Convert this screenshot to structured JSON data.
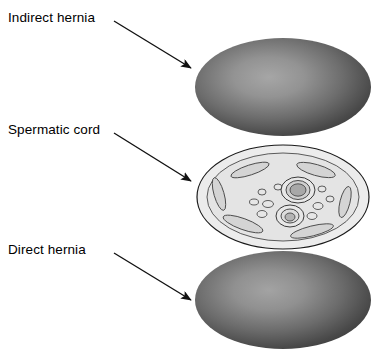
{
  "figure": {
    "type": "anatomical-diagram",
    "background_color": "#ffffff",
    "width": 380,
    "height": 354
  },
  "labels": {
    "indirect": "Indirect hernia",
    "spermatic": "Spermatic cord",
    "direct": "Direct hernia"
  },
  "annotations": [
    {
      "name": "indirect-hernia",
      "text": "Indirect hernia",
      "label_x": 8,
      "label_y": 10,
      "leader_start": [
        114,
        21
      ],
      "leader_end": [
        193,
        69
      ]
    },
    {
      "name": "spermatic-cord",
      "text": "Spermatic cord",
      "label_x": 8,
      "label_y": 122,
      "leader_start": [
        114,
        133
      ],
      "leader_end": [
        193,
        182
      ]
    },
    {
      "name": "direct-hernia",
      "text": "Direct hernia",
      "label_x": 8,
      "label_y": 242,
      "leader_start": [
        114,
        253
      ],
      "leader_end": [
        193,
        301
      ]
    }
  ],
  "shapes": {
    "indirect_hernia_mass": {
      "name": "indirect-hernia-mass",
      "shape": "ellipse",
      "cx": 283,
      "cy": 87,
      "rx": 88,
      "ry": 49,
      "fill_center": "#9a9a9a",
      "fill_edge": "#3c3c3c",
      "highlight_offset": [
        0.42,
        0.4
      ]
    },
    "spermatic_cord_disc": {
      "name": "spermatic-cord-disc",
      "shape": "ellipse",
      "cx": 283,
      "cy": 197,
      "rx": 86,
      "ry": 52,
      "fill": "#ececec",
      "stroke": "#1a1a1a",
      "inner_ring": {
        "rx": 76,
        "ry": 44,
        "fill": "#e2e2e2",
        "stroke": "#3a3a3a"
      }
    },
    "direct_hernia_mass": {
      "name": "direct-hernia-mass",
      "shape": "ellipse",
      "cx": 283,
      "cy": 300,
      "rx": 88,
      "ry": 49,
      "fill_center": "#9a9a9a",
      "fill_edge": "#3c3c3c",
      "highlight_offset": [
        0.42,
        0.4
      ]
    }
  },
  "cord_contents": {
    "cremaster_fibers": [
      {
        "name": "cremaster-fiber-top-left",
        "cx": 250,
        "cy": 170,
        "rx": 20,
        "ry": 5,
        "rotate": -18
      },
      {
        "name": "cremaster-fiber-top-right",
        "cx": 316,
        "cy": 170,
        "rx": 20,
        "ry": 5.5,
        "rotate": 16
      },
      {
        "name": "cremaster-fiber-left",
        "cx": 219,
        "cy": 194,
        "rx": 17,
        "ry": 5,
        "rotate": 74
      },
      {
        "name": "cremaster-fiber-right",
        "cx": 345,
        "cy": 200,
        "rx": 15,
        "ry": 5,
        "rotate": 104
      },
      {
        "name": "cremaster-fiber-bottom-left",
        "cx": 243,
        "cy": 224,
        "rx": 21,
        "ry": 5.5,
        "rotate": 20
      },
      {
        "name": "cremaster-fiber-bottom-right",
        "cx": 312,
        "cy": 231,
        "rx": 22,
        "ry": 5,
        "rotate": -14
      }
    ],
    "vas_deferens": {
      "name": "vas-deferens",
      "cx": 298,
      "cy": 190,
      "outer_rx": 17,
      "outer_ry": 13,
      "mid_rx": 12,
      "mid_ry": 9,
      "lumen_rx": 8,
      "lumen_ry": 6,
      "outer_fill": "#e8e8e8",
      "mid_fill": "#d0d0d0",
      "lumen_fill": "#a8a8a8"
    },
    "testicular_vessel": {
      "name": "testicular-vessel",
      "cx": 290,
      "cy": 215,
      "outer_rx": 14,
      "outer_ry": 11,
      "mid_rx": 9,
      "mid_ry": 7,
      "lumen_rx": 5,
      "lumen_ry": 4,
      "outer_fill": "#e8e8e8",
      "mid_fill": "#dcdcdc",
      "lumen_fill": "#b4b4b4"
    },
    "pampiniform_veins": [
      {
        "name": "vein-1",
        "cx": 262,
        "cy": 192,
        "rx": 4,
        "ry": 3
      },
      {
        "name": "vein-2",
        "cx": 254,
        "cy": 202,
        "rx": 4.5,
        "ry": 3
      },
      {
        "name": "vein-3",
        "cx": 268,
        "cy": 204,
        "rx": 5.5,
        "ry": 3.5
      },
      {
        "name": "vein-4",
        "cx": 262,
        "cy": 214,
        "rx": 5,
        "ry": 3.5
      },
      {
        "name": "vein-5",
        "cx": 278,
        "cy": 187,
        "rx": 4,
        "ry": 3
      },
      {
        "name": "vein-6",
        "cx": 322,
        "cy": 189,
        "rx": 4,
        "ry": 3
      },
      {
        "name": "vein-7",
        "cx": 330,
        "cy": 199,
        "rx": 4,
        "ry": 3
      },
      {
        "name": "vein-8",
        "cx": 318,
        "cy": 206,
        "rx": 5,
        "ry": 3.5
      },
      {
        "name": "vein-9",
        "cx": 312,
        "cy": 216,
        "rx": 5,
        "ry": 3.5
      }
    ],
    "fiber_fill": "#d4d4d4",
    "fiber_stroke": "#4a4a4a",
    "vein_fill": "#e6e6e6",
    "vein_stroke": "#3a3a3a"
  },
  "colors": {
    "text": "#000000",
    "leader_line": "#111111",
    "mass_dark": "#3c3c3c",
    "mass_light": "#9a9a9a",
    "cord_fill": "#ececec",
    "outline": "#1a1a1a"
  }
}
